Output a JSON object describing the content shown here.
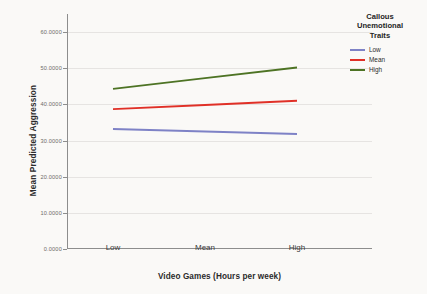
{
  "chart_data": {
    "type": "line",
    "title": "",
    "xlabel": "Video Games (Hours per week)",
    "ylabel": "Mean Predicted Aggression",
    "categories": [
      "Low",
      "Mean",
      "High"
    ],
    "ylim": [
      0.0,
      65.0
    ],
    "yticks": [
      0.0,
      10.0,
      20.0,
      30.0,
      40.0,
      50.0,
      60.0
    ],
    "ytick_labels": [
      "0.0000",
      "10.0000",
      "20.0000",
      "30.0000",
      "40.0000",
      "50.0000",
      "60.0000"
    ],
    "grid": true,
    "legend_position": "right-top",
    "legend_title": "Callous Unemotional Traits",
    "legend_title_lines": [
      "Callous",
      "Unemotional",
      "Traits"
    ],
    "series": [
      {
        "name": "Low",
        "values": [
          33.2,
          32.5,
          31.8
        ],
        "color": "#7e82c6"
      },
      {
        "name": "Mean",
        "values": [
          38.7,
          39.85,
          41.0
        ],
        "color": "#e03027"
      },
      {
        "name": "High",
        "values": [
          44.3,
          47.25,
          50.2
        ],
        "color": "#4d7324"
      }
    ]
  },
  "axes": {
    "y_title": "Mean Predicted Aggression",
    "x_title": "Video Games (Hours per week)",
    "y_tick_labels": [
      "60.0000",
      "50.0000",
      "40.0000",
      "30.0000",
      "20.0000",
      "10.0000",
      "0.0000"
    ],
    "x_tick_labels": [
      "Low",
      "Mean",
      "High"
    ]
  },
  "legend": {
    "title_line_1": "Callous",
    "title_line_2": "Unemotional",
    "title_line_3": "Traits",
    "items": [
      {
        "label": "Low",
        "color": "#7e82c6"
      },
      {
        "label": "Mean",
        "color": "#e03027"
      },
      {
        "label": "High",
        "color": "#4d7324"
      }
    ]
  }
}
